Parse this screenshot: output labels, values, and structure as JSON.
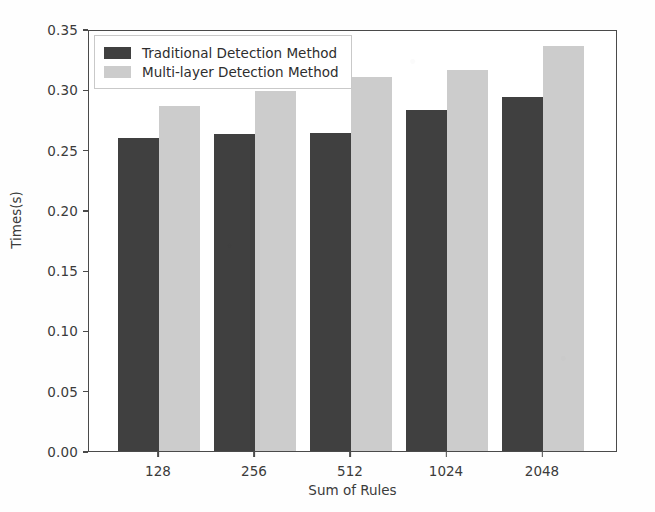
{
  "chart_data": {
    "type": "bar",
    "title": "",
    "xlabel": "Sum of Rules",
    "ylabel": "Times(s)",
    "categories": [
      "128",
      "256",
      "512",
      "1024",
      "2048"
    ],
    "series": [
      {
        "name": "Traditional Detection Method",
        "color": "#404040",
        "values": [
          0.26,
          0.263,
          0.264,
          0.283,
          0.294
        ]
      },
      {
        "name": "Multi-layer Detection Method",
        "color": "#cccccc",
        "values": [
          0.286,
          0.299,
          0.31,
          0.316,
          0.336
        ]
      }
    ],
    "ylim": [
      0.0,
      0.35
    ],
    "yticks": [
      "0.00",
      "0.05",
      "0.10",
      "0.15",
      "0.20",
      "0.25",
      "0.30",
      "0.35"
    ],
    "ytick_values": [
      0.0,
      0.05,
      0.1,
      0.15,
      0.2,
      0.25,
      0.3,
      0.35
    ],
    "grid": false,
    "legend_position": "upper left"
  },
  "legend": {
    "entries": [
      {
        "label": "Traditional Detection Method"
      },
      {
        "label": "Multi-layer Detection Method"
      }
    ]
  }
}
